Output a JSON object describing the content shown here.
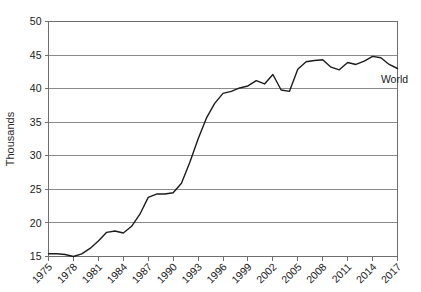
{
  "chart_data": {
    "type": "line",
    "title": "",
    "xlabel": "",
    "ylabel": "Thousands",
    "xlim": [
      1975,
      2017
    ],
    "ylim": [
      15,
      50
    ],
    "grid": true,
    "grid_axis": "y",
    "legend_position": "inline-right",
    "y_ticks": [
      15,
      20,
      25,
      30,
      35,
      40,
      45,
      50
    ],
    "y_tick_labels": [
      "15",
      "20",
      "25",
      "30",
      "35",
      "40",
      "45",
      "50"
    ],
    "x_ticks": [
      1975,
      1978,
      1981,
      1984,
      1987,
      1990,
      1993,
      1996,
      1999,
      2002,
      2005,
      2008,
      2011,
      2014,
      2017
    ],
    "x_tick_labels": [
      "1975",
      "1978",
      "1981",
      "1984",
      "1987",
      "1990",
      "1993",
      "1996",
      "1999",
      "2002",
      "2005",
      "2008",
      "2011",
      "2014",
      "2017"
    ],
    "x_tick_rotation": -45,
    "line_color": "#1c1c1c",
    "series": [
      {
        "name": "World",
        "label_at_x": 2015,
        "x": [
          1975,
          1976,
          1977,
          1978,
          1979,
          1980,
          1981,
          1982,
          1983,
          1984,
          1985,
          1986,
          1987,
          1988,
          1989,
          1990,
          1991,
          1992,
          1993,
          1994,
          1995,
          1996,
          1997,
          1998,
          1999,
          2000,
          2001,
          2002,
          2003,
          2004,
          2005,
          2006,
          2007,
          2008,
          2009,
          2010,
          2011,
          2012,
          2013,
          2014,
          2015,
          2016,
          2017
        ],
        "values": [
          15.4,
          15.4,
          15.3,
          15.0,
          15.4,
          16.2,
          17.3,
          18.6,
          18.8,
          18.5,
          19.5,
          21.3,
          23.8,
          24.3,
          24.3,
          24.5,
          25.9,
          29.0,
          32.5,
          35.6,
          37.8,
          39.3,
          39.6,
          40.1,
          40.4,
          41.2,
          40.7,
          42.1,
          39.8,
          39.6,
          42.9,
          44.0,
          44.2,
          44.3,
          43.2,
          42.8,
          43.9,
          43.6,
          44.1,
          44.8,
          44.6,
          43.6,
          43.0
        ]
      }
    ]
  },
  "axis": {
    "y_title": "Thousands"
  },
  "series_labels": {
    "world": "World"
  }
}
